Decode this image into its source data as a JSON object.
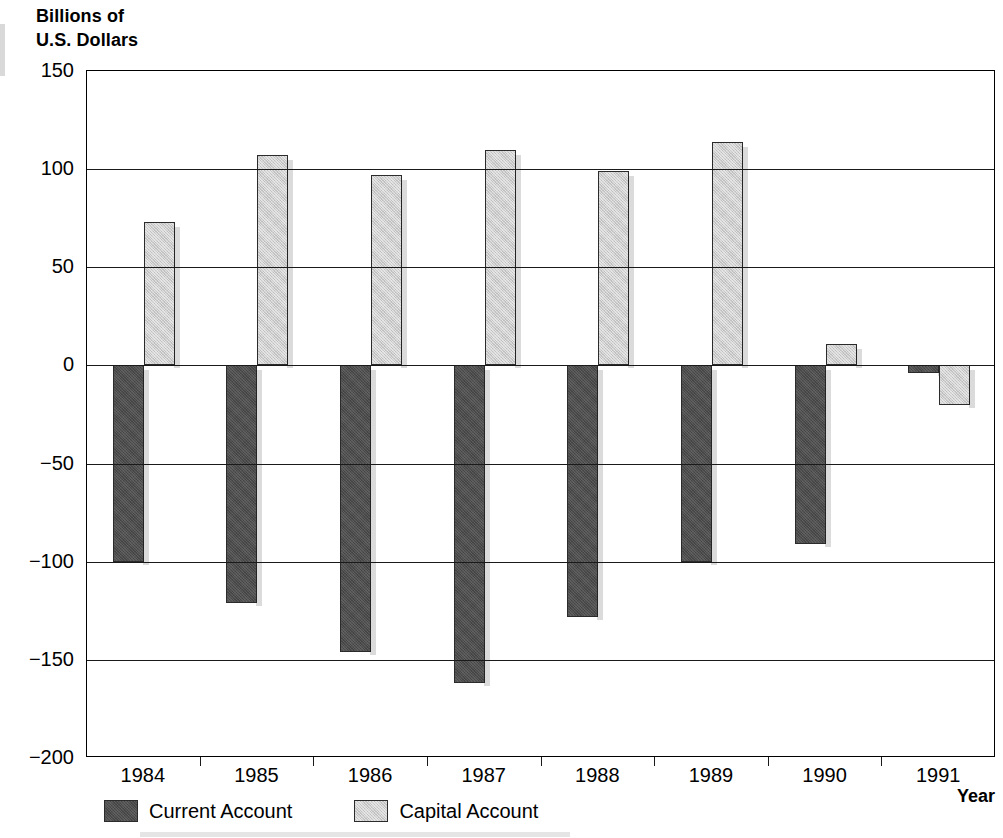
{
  "chart_data": {
    "type": "bar",
    "title": "Billions of\nU.S. Dollars",
    "ylabel": "Billions of U.S. Dollars",
    "xlabel": "Year",
    "categories": [
      "1984",
      "1985",
      "1986",
      "1987",
      "1988",
      "1989",
      "1990",
      "1991"
    ],
    "series": [
      {
        "name": "Current Account",
        "color": "#4d4d4d",
        "values": [
          -100,
          -121,
          -146,
          -162,
          -128,
          -100,
          -91,
          -4
        ]
      },
      {
        "name": "Capital Account",
        "color": "#cdcdcd",
        "values": [
          73,
          107,
          97,
          110,
          99,
          114,
          11,
          -20
        ]
      }
    ],
    "ylim": [
      -200,
      150
    ],
    "yticks": [
      150,
      100,
      50,
      0,
      -50,
      -100,
      -150,
      -200
    ],
    "ytick_labels": [
      "150",
      "100",
      "50",
      "0",
      "−50",
      "−100",
      "−150",
      "−200"
    ],
    "grid": true,
    "legend_position": "bottom-left"
  },
  "legend": {
    "items": [
      {
        "label": "Current Account",
        "swatch": "current"
      },
      {
        "label": "Capital Account",
        "swatch": "capital"
      }
    ]
  }
}
